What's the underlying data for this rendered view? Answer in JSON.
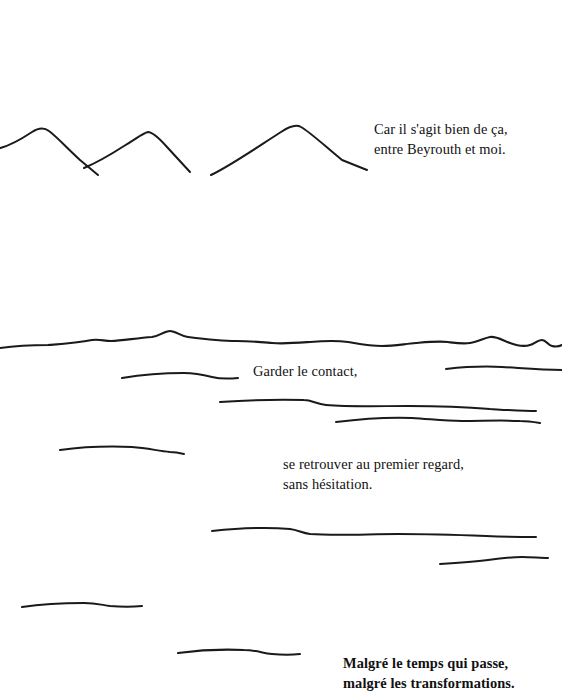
{
  "page": {
    "width": 562,
    "height": 700,
    "background_color": "#ffffff",
    "ink_color": "#1a1a1a",
    "language": "French",
    "kind": "illustrated-book-page"
  },
  "captions": [
    {
      "id": "caption-mountains",
      "text": "Car il s'agit bien de ça,\nentre Beyrouth et moi.",
      "lines": [
        "Car il s'agit bien de ça,",
        "entre Beyrouth et moi."
      ],
      "x": 374,
      "y": 120
    },
    {
      "id": "caption-garder-le-contact",
      "text": "Garder le contact,",
      "lines": [
        "Garder le contact,"
      ],
      "x": 253,
      "y": 362
    },
    {
      "id": "caption-se-retrouver",
      "text": "se retrouver au premier regard,\nsans hésitation.",
      "lines": [
        "se retrouver au premier regard,",
        "sans hésitation."
      ],
      "x": 283,
      "y": 455
    },
    {
      "id": "caption-malgre-le-temps",
      "text": "Malgré le temps qui passe,\nmalgré les transformations.",
      "lines": [
        "Malgré le temps qui passe,",
        "malgré les transformations."
      ],
      "x": 343,
      "y": 654
    }
  ],
  "artwork": {
    "stroke_color": "#1a1a1a",
    "strokes": [
      {
        "name": "mountain-ridge-left",
        "kind": "mountain-peak",
        "path": "M -4 149 C 8 147 20 140 32 132 C 38 128 44 127 49 131 C 57 137 68 149 80 160 L 98 175"
      },
      {
        "name": "mountain-ridge-middle",
        "kind": "mountain-peak",
        "path": "M 84 168 C 96 163 110 155 124 146 C 136 139 143 133 148 132 C 153 132 159 138 167 147 L 190 172"
      },
      {
        "name": "mountain-ridge-right",
        "kind": "mountain-peak",
        "path": "M 211 175 C 230 166 256 148 281 132 C 290 126 296 124 301 127 C 310 132 326 147 342 160 L 367 170"
      },
      {
        "name": "horizon-line-long",
        "kind": "horizon",
        "path": "M 0 348 C 14 346 30 345 48 345 C 62 344 78 343 92 340 C 100 339 104 341 111 341 C 122 341 136 338 152 337 C 160 336 164 331 170 331 C 176 331 180 336 188 337 C 204 339 220 341 236 341 C 250 341 260 342 272 343 C 284 344 296 343 310 342 C 322 341 334 340 348 342 C 360 344 370 346 382 346 C 394 346 404 344 416 343 C 428 342 438 341 448 342 C 456 343 462 344 470 343 C 478 342 484 338 490 337 C 496 336 502 340 510 343 C 518 346 524 347 530 345 C 534 344 538 340 542 340 C 546 340 548 345 552 346 C 556 347 560 346 562 345"
      },
      {
        "name": "line-short-upper-left",
        "kind": "ground-line",
        "path": "M 122 378 C 140 375 162 373 184 373 C 196 373 204 375 212 377 C 220 379 228 379 238 378"
      },
      {
        "name": "line-short-upper-right",
        "kind": "ground-line",
        "path": "M 446 369 C 464 367 484 366 502 367 C 520 368 540 370 562 370"
      },
      {
        "name": "line-mid-wide",
        "kind": "ground-line",
        "path": "M 220 402 C 250 400 278 399 304 400 C 312 400 316 404 326 405 C 350 407 380 406 408 406 C 436 406 466 407 490 409 C 508 410 524 411 536 411"
      },
      {
        "name": "line-mid-lower",
        "kind": "ground-line",
        "path": "M 336 422 C 360 419 386 417 412 418 C 430 419 444 421 462 421 C 482 421 502 420 520 421 C 528 421 534 422 540 423"
      },
      {
        "name": "line-left-mid",
        "kind": "ground-line",
        "path": "M 60 450 C 82 447 108 446 132 447 C 148 448 158 451 170 452 C 176 452 180 453 184 454"
      },
      {
        "name": "line-wide-lower",
        "kind": "ground-line",
        "path": "M 212 531 C 240 528 268 527 290 529 C 298 530 302 533 310 534 C 336 536 368 534 398 534 C 428 534 460 535 486 536 C 506 537 522 537 536 537"
      },
      {
        "name": "line-right-lower",
        "kind": "ground-line",
        "path": "M 440 564 C 456 563 472 562 488 560 C 502 558 512 557 522 557 C 532 557 540 558 548 558"
      },
      {
        "name": "line-left-bottom",
        "kind": "ground-line",
        "path": "M 22 607 C 42 604 64 603 84 603 C 96 603 102 605 110 606 C 122 607 132 607 142 606"
      },
      {
        "name": "line-center-bottom",
        "kind": "ground-line",
        "path": "M 178 653 C 200 650 222 649 244 650 C 256 650 262 653 272 654 C 282 655 292 655 300 654"
      }
    ]
  }
}
